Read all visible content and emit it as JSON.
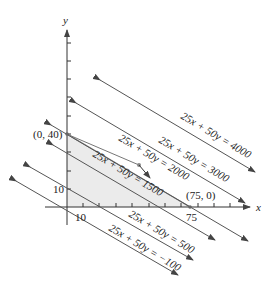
{
  "diagram": {
    "title": "",
    "axes": {
      "x_label": "x",
      "y_label": "y",
      "x_tick_labels": [
        {
          "value": "10",
          "x": 80
        },
        {
          "value": "75",
          "x": 190
        }
      ],
      "y_tick_labels": [
        {
          "value": "10",
          "y": 189
        }
      ]
    },
    "points": [
      {
        "label": "(0, 40)",
        "x": 0,
        "y": 40
      },
      {
        "label": "(75, 0)",
        "x": 75,
        "y": 0
      }
    ],
    "level_lines": [
      {
        "label": "25x + 50y = 4000",
        "value": 4000
      },
      {
        "label": "25x + 50y = 3000",
        "value": 3000
      },
      {
        "label": "25x + 50y = 2000",
        "value": 2000
      },
      {
        "label": "25x + 50y = 1500",
        "value": 1500
      },
      {
        "label": "25x + 50y = 500",
        "value": 500
      },
      {
        "label": "25x + 50y = −100",
        "value": -100
      }
    ],
    "feasible_region": {
      "vertices": [
        "(0, 0)",
        "(0, 40)",
        "(75, 0)"
      ],
      "fill": "#ebebeb"
    },
    "colors": {
      "line": "#555555",
      "axis": "#333333",
      "shade": "#ebebeb",
      "boundary": "#888888"
    }
  }
}
